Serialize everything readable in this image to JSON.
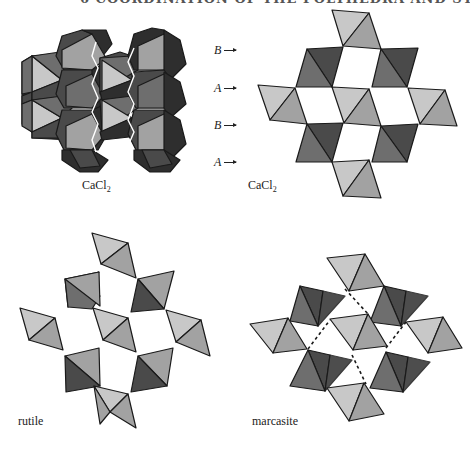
{
  "page": {
    "header_fragment": "6  COORDINATION OF THE POLYHEDRA AND STRUCTURES"
  },
  "colors": {
    "light": "#c8c8c8",
    "mid": "#a2a2a2",
    "dark": "#6e6e6e",
    "darker": "#4a4a4a",
    "darkest": "#2e2e2e",
    "outline": "#1a1a1a",
    "background": "#ffffff"
  },
  "figures": [
    {
      "id": "cacl2-perspective",
      "caption_main": "CaCl",
      "caption_sub": "2",
      "caption_pos": [
        82,
        178
      ]
    },
    {
      "id": "cacl2-projection",
      "caption_main": "CaCl",
      "caption_sub": "2",
      "caption_pos": [
        248,
        178
      ],
      "layer_labels": [
        {
          "letter": "B",
          "y": 43
        },
        {
          "letter": "A",
          "y": 81
        },
        {
          "letter": "B",
          "y": 118
        },
        {
          "letter": "A",
          "y": 155
        }
      ]
    },
    {
      "id": "rutile",
      "caption": "rutile",
      "caption_pos": [
        18,
        414
      ]
    },
    {
      "id": "marcasite",
      "caption": "marcasite",
      "caption_pos": [
        252,
        414
      ]
    }
  ]
}
